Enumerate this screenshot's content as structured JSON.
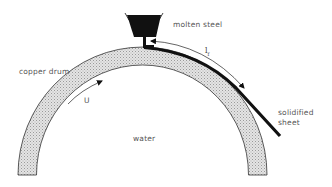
{
  "diagram": {
    "labels": {
      "molten_steel": "molten steel",
      "copper_drum": "copper drum",
      "velocity": "U",
      "water": "water",
      "solidified_sheet_line1": "solidified",
      "solidified_sheet_line2": "sheet",
      "length_main": "l",
      "length_sub": "f"
    },
    "colors": {
      "drum_fill": "#dcdcdc",
      "drum_stroke": "#333333",
      "steel": "#111111",
      "text": "#555555",
      "background": "#ffffff"
    },
    "components": [
      {
        "id": "tundish",
        "description": "trapezoidal vessel containing molten steel at top of drum"
      },
      {
        "id": "copper-drum",
        "description": "semicircular hatched copper drum rotating with surface speed U"
      },
      {
        "id": "solidified-sheet",
        "description": "thick black strip leaving drum tangentially to lower right"
      },
      {
        "id": "contact-length-arrow",
        "description": "double-headed arrow marking contact length l_f"
      },
      {
        "id": "velocity-arrow",
        "description": "arrow along drum surface indicating rotation direction U"
      }
    ]
  }
}
